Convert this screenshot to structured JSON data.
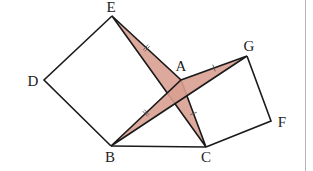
{
  "diagram": {
    "type": "geometry-figure",
    "colors": {
      "fill": "#d9a092",
      "stroke": "#1a1a1a",
      "divider": "#b5b5b5"
    },
    "points": {
      "A": {
        "label": "A",
        "x": 181,
        "y": 80,
        "lx": 181,
        "ly": 71
      },
      "B": {
        "label": "B",
        "x": 111,
        "y": 146,
        "lx": 110,
        "ly": 162
      },
      "C": {
        "label": "C",
        "x": 206,
        "y": 147,
        "lx": 206,
        "ly": 162
      },
      "D": {
        "label": "D",
        "x": 44,
        "y": 80,
        "lx": 33,
        "ly": 86
      },
      "E": {
        "label": "E",
        "x": 112,
        "y": 16,
        "lx": 111,
        "ly": 12
      },
      "F": {
        "label": "F",
        "x": 271,
        "y": 121,
        "lx": 282,
        "ly": 127
      },
      "G": {
        "label": "G",
        "x": 247,
        "y": 56,
        "lx": 249,
        "ly": 51
      }
    },
    "squares": [
      {
        "name": "square-ABDE",
        "vertices": [
          "A",
          "E",
          "D",
          "B"
        ]
      },
      {
        "name": "square-ACFG",
        "vertices": [
          "A",
          "G",
          "F",
          "C"
        ]
      }
    ],
    "shaded_triangles": [
      {
        "name": "triangle-AEC",
        "vertices": [
          "E",
          "A",
          "C"
        ]
      },
      {
        "name": "triangle-ABG",
        "vertices": [
          "B",
          "A",
          "G"
        ]
      }
    ],
    "segments": [
      {
        "from": "B",
        "to": "C"
      }
    ],
    "tick_marks": [
      {
        "segment": "EA",
        "count": 2
      },
      {
        "segment": "AB",
        "count": 2
      },
      {
        "segment": "AG",
        "count": 1
      },
      {
        "segment": "AC",
        "count": 1
      }
    ]
  }
}
